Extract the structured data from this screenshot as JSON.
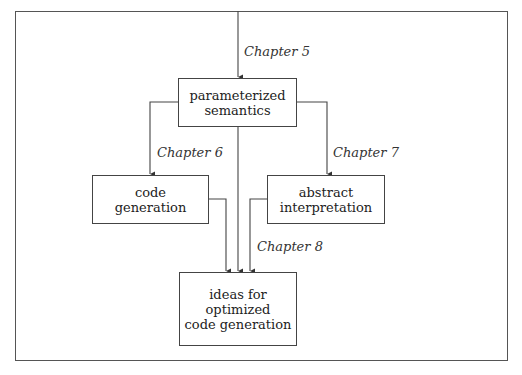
{
  "diagram": {
    "nodes": {
      "parameterized": {
        "line1": "parameterized",
        "line2": "semantics"
      },
      "code_gen": {
        "line1": "code",
        "line2": "generation"
      },
      "abstract": {
        "line1": "abstract",
        "line2": "interpretation"
      },
      "ideas": {
        "line1": "ideas for",
        "line2": "optimized",
        "line3": "code generation"
      }
    },
    "edges": {
      "ch5": "Chapter 5",
      "ch6": "Chapter 6",
      "ch7": "Chapter 7",
      "ch8": "Chapter 8"
    },
    "colors": {
      "line": "#444444",
      "background": "#ffffff"
    }
  }
}
